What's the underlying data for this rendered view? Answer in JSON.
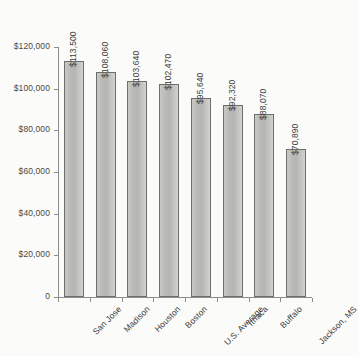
{
  "chart_data": {
    "type": "bar",
    "title": "",
    "subtitle": "",
    "xlabel": "",
    "ylabel": "",
    "categories": [
      "San Jose",
      "Madison",
      "Houston",
      "Boston",
      "U.S. Average",
      "Ithaca",
      "Buffalo",
      "Jackson, MS"
    ],
    "values": [
      113500,
      108060,
      103640,
      102470,
      95640,
      92320,
      88070,
      70890
    ],
    "value_labels": [
      "$113,500",
      "$108,060",
      "$103,640",
      "$102,470",
      "$95,640",
      "$92,320",
      "$88,070",
      "$70,890"
    ],
    "ylim": [
      0,
      120000
    ],
    "ytick_values": [
      120000,
      100000,
      80000,
      60000,
      40000,
      20000,
      0
    ],
    "ytick_labels": [
      "$120,000",
      "$100,000",
      "$80,000",
      "$60,000",
      "$40,000",
      "$20,000",
      "0"
    ],
    "grid": false,
    "legend": false,
    "legend_position": "none",
    "bar_fill_color": "#bdbdba",
    "bar_border_color": "#6e6e6b",
    "axis_color": "#8d8d8a",
    "text_color": "#3c3c3a",
    "background_color": "#fbfbf9"
  }
}
